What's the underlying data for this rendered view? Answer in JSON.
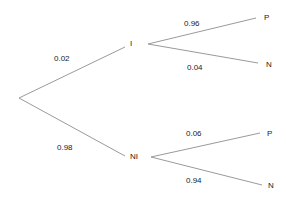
{
  "diagram": {
    "type": "probability-tree",
    "root": {
      "branches": [
        {
          "label": "I",
          "probability": "0.02",
          "children": [
            {
              "label": "P",
              "probability": "0.96"
            },
            {
              "label": "N",
              "probability": "0.04"
            }
          ]
        },
        {
          "label": "NI",
          "probability": "0.98",
          "children": [
            {
              "label": "P",
              "probability": "0.06"
            },
            {
              "label": "N",
              "probability": "0.94"
            }
          ]
        }
      ]
    },
    "line_color": "#9a9a9a"
  }
}
